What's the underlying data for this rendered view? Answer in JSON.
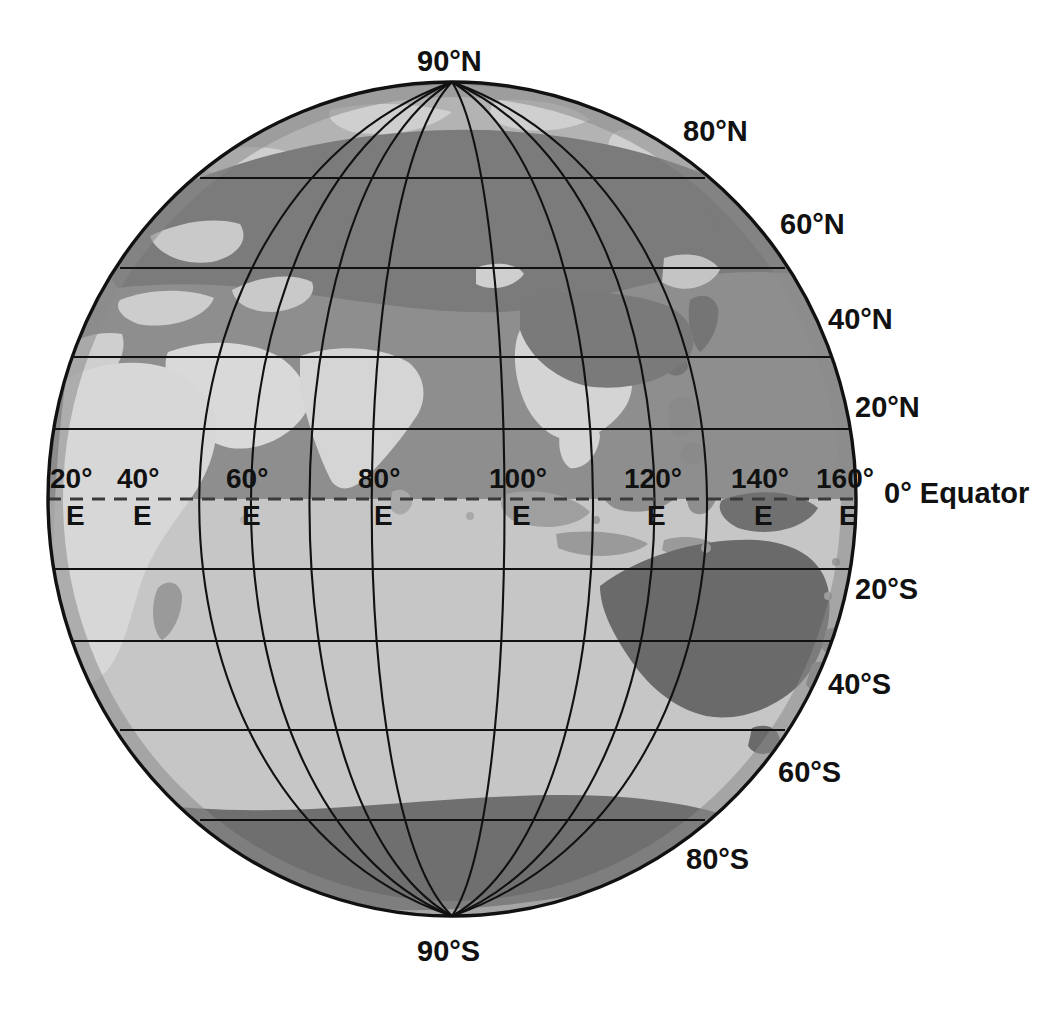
{
  "figure": {
    "type": "globe-graticule-map",
    "title_visible": false,
    "projection": "orthographic",
    "center_lon": 90,
    "center_lat": 0,
    "colors": {
      "background": "#ffffff",
      "ocean_north": "#8d8d8d",
      "ocean_south": "#bdbdbd",
      "land_dark": "#6e6e6e",
      "land_light": "#d8d8d8",
      "polar_cap": "#b5b5b5",
      "outline": "#111111",
      "graticule": "#111111",
      "equator_dash": "#444444",
      "label_text": "#111111"
    },
    "geometry": {
      "cx": 452,
      "cy": 499,
      "rx": 404,
      "ry": 417
    }
  },
  "latitude_labels": [
    {
      "id": "lat-90n",
      "text": "90°N",
      "value": 90,
      "hemisphere": "N",
      "x": 417,
      "y": 45
    },
    {
      "id": "lat-80n",
      "text": "80°N",
      "value": 80,
      "hemisphere": "N",
      "x": 683,
      "y": 115
    },
    {
      "id": "lat-60n",
      "text": "60°N",
      "value": 60,
      "hemisphere": "N",
      "x": 780,
      "y": 208
    },
    {
      "id": "lat-40n",
      "text": "40°N",
      "value": 40,
      "hemisphere": "N",
      "x": 828,
      "y": 303
    },
    {
      "id": "lat-20n",
      "text": "20°N",
      "value": 20,
      "hemisphere": "N",
      "x": 855,
      "y": 391
    },
    {
      "id": "lat-20s",
      "text": "20°S",
      "value": -20,
      "hemisphere": "S",
      "x": 855,
      "y": 573
    },
    {
      "id": "lat-40s",
      "text": "40°S",
      "value": -40,
      "hemisphere": "S",
      "x": 828,
      "y": 668
    },
    {
      "id": "lat-60s",
      "text": "60°S",
      "value": -60,
      "hemisphere": "S",
      "x": 778,
      "y": 756
    },
    {
      "id": "lat-80s",
      "text": "80°S",
      "value": -80,
      "hemisphere": "S",
      "x": 686,
      "y": 843
    },
    {
      "id": "lat-90s",
      "text": "90°S",
      "value": -90,
      "hemisphere": "S",
      "x": 417,
      "y": 935
    }
  ],
  "equator_label": {
    "id": "equator",
    "text": "0° Equator",
    "value": 0,
    "x": 884,
    "y": 477
  },
  "longitude_labels": [
    {
      "id": "lon-20e",
      "degrees": "20°",
      "suffix": "E",
      "value": 20,
      "num_x": 50,
      "num_y": 463,
      "e_x": 66,
      "e_y": 500
    },
    {
      "id": "lon-40e",
      "degrees": "40°",
      "suffix": "E",
      "value": 40,
      "num_x": 117,
      "num_y": 463,
      "e_x": 133,
      "e_y": 500
    },
    {
      "id": "lon-60e",
      "degrees": "60°",
      "suffix": "E",
      "value": 60,
      "num_x": 226,
      "num_y": 463,
      "e_x": 242,
      "e_y": 500
    },
    {
      "id": "lon-80e",
      "degrees": "80°",
      "suffix": "E",
      "value": 80,
      "num_x": 358,
      "num_y": 463,
      "e_x": 374,
      "e_y": 500
    },
    {
      "id": "lon-100e",
      "degrees": "100°",
      "suffix": "E",
      "value": 100,
      "num_x": 489,
      "num_y": 463,
      "e_x": 512,
      "e_y": 500
    },
    {
      "id": "lon-120e",
      "degrees": "120°",
      "suffix": "E",
      "value": 120,
      "num_x": 624,
      "num_y": 463,
      "e_x": 647,
      "e_y": 500
    },
    {
      "id": "lon-140e",
      "degrees": "140°",
      "suffix": "E",
      "value": 140,
      "num_x": 731,
      "num_y": 463,
      "e_x": 754,
      "e_y": 500
    },
    {
      "id": "lon-160e",
      "degrees": "160°",
      "suffix": "E",
      "value": 160,
      "num_x": 816,
      "num_y": 463,
      "e_x": 839,
      "e_y": 500
    }
  ],
  "graticule": {
    "latitude_interval_deg": 20,
    "longitude_interval_deg": 20,
    "equator_style": "dashed",
    "other_style": "solid"
  },
  "landmasses": [
    "Eurasia",
    "Africa",
    "Arabian Peninsula",
    "Indian subcontinent",
    "Southeast Asia",
    "Indonesia",
    "Australia",
    "New Guinea",
    "New Zealand",
    "Antarctica",
    "Japan",
    "Madagascar",
    "Sri Lanka"
  ]
}
